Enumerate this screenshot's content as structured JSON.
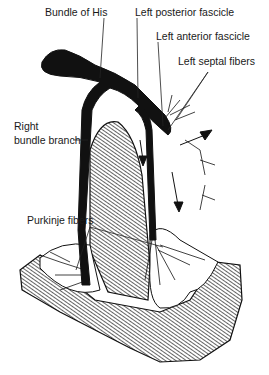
{
  "diagram": {
    "labels": {
      "bundle_of_his": "Bundle of His",
      "left_posterior_fascicle": "Left posterior fascicle",
      "left_anterior_fascicle": "Left anterior fascicle",
      "left_septal_fibers": "Left septal fibers",
      "right_bundle_branch_line1": "Right",
      "right_bundle_branch_line2": "bundle branch",
      "purkinje_fibers": "Purkinje fibers"
    },
    "colors": {
      "ink": "#111111",
      "background": "#ffffff",
      "hatch": "#222222"
    }
  }
}
